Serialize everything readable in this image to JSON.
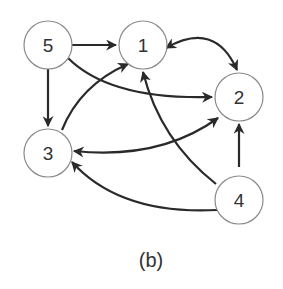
{
  "diagram": {
    "caption": "(b)",
    "nodes": [
      {
        "id": "5",
        "label": "5"
      },
      {
        "id": "1",
        "label": "1"
      },
      {
        "id": "2",
        "label": "2"
      },
      {
        "id": "3",
        "label": "3"
      },
      {
        "id": "4",
        "label": "4"
      }
    ],
    "edges": [
      {
        "from": "5",
        "to": "1",
        "directed": true
      },
      {
        "from": "5",
        "to": "3",
        "directed": true
      },
      {
        "from": "5",
        "to": "2",
        "directed": true
      },
      {
        "from": "3",
        "to": "1",
        "directed": true
      },
      {
        "from": "1",
        "to": "2",
        "bidirectional": true
      },
      {
        "from": "3",
        "to": "2",
        "bidirectional": true
      },
      {
        "from": "4",
        "to": "1",
        "directed": true
      },
      {
        "from": "4",
        "to": "2",
        "directed": true
      },
      {
        "from": "4",
        "to": "3",
        "directed": true
      }
    ],
    "colors": {
      "edge": "#2a2a2a",
      "node_stroke": "#8a8a8a",
      "text": "#333333"
    }
  }
}
